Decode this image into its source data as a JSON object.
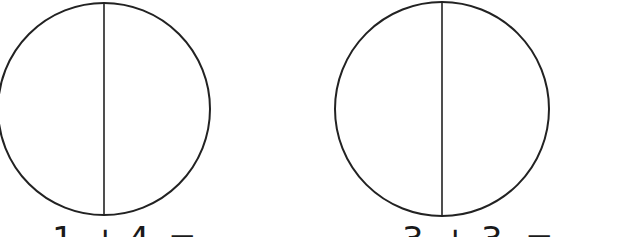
{
  "figures": [
    {
      "type": "circle-divided-in-halves",
      "center": [
        104,
        109
      ],
      "radius": 106,
      "equation": {
        "a": "1",
        "op": "+",
        "b": "4",
        "eq": "="
      }
    },
    {
      "type": "circle-divided-in-halves",
      "center": [
        442,
        109
      ],
      "radius": 107,
      "equation": {
        "a": "3",
        "op": "+",
        "b": "3",
        "eq": "="
      }
    }
  ],
  "colors": {
    "stroke": "#222222",
    "background": "#ffffff",
    "text": "#1a1a1a"
  }
}
